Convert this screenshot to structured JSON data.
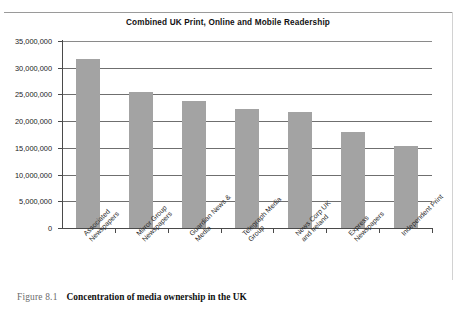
{
  "figure": {
    "caption_number": "Figure 8.1",
    "caption_text": "Concentration of media ownership in the UK"
  },
  "chart_data": {
    "type": "bar",
    "title": "Combined UK Print, Online and Mobile Readership",
    "xlabel": "",
    "ylabel": "",
    "ylim": [
      0,
      35000000
    ],
    "ytick_step": 5000000,
    "grid": true,
    "legend": "none",
    "bar_color": "#a3a3a3",
    "categories": [
      "Associated Newspapers",
      "Mirror Group Newspapers",
      "Guardian News & Media",
      "Telegraph Media Group",
      "News Corp UK and Ireland",
      "Express Newspapers",
      "Independent Print"
    ],
    "category_lines": [
      [
        "Associated",
        "Newspapers"
      ],
      [
        "Mirror Group",
        "Newspapers"
      ],
      [
        "Guardian News &",
        "Media"
      ],
      [
        "Telegraph Media",
        "Group"
      ],
      [
        "News Corp UK",
        "and Ireland"
      ],
      [
        "Express",
        "Newspapers"
      ],
      [
        "Independent Print"
      ]
    ],
    "values": [
      31600000,
      25500000,
      23700000,
      22200000,
      21800000,
      18000000,
      15400000
    ],
    "ytick_labels": [
      "35,000,000",
      "30,000,000",
      "25,000,000",
      "20,000,000",
      "15,000,000",
      "10,000,000",
      "5,000,000",
      "0"
    ],
    "ytick_values": [
      35000000,
      30000000,
      25000000,
      20000000,
      15000000,
      10000000,
      5000000,
      0
    ]
  }
}
